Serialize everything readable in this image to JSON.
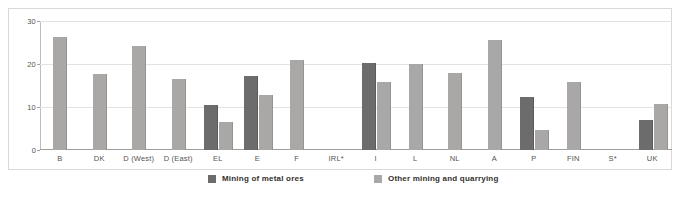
{
  "chart_data": {
    "type": "bar",
    "title": "",
    "subtitle": "",
    "xlabel": "",
    "ylabel": "",
    "ylim": [
      0,
      30
    ],
    "yticks": [
      0,
      10,
      20,
      30
    ],
    "ytick_labels": [
      "0",
      "10",
      "20",
      "30"
    ],
    "grid": true,
    "legend_position": "bottom",
    "categories": [
      "B",
      "DK",
      "D (West)",
      "D (East)",
      "EL",
      "E",
      "F",
      "IRL*",
      "I",
      "L",
      "NL",
      "A",
      "P",
      "FIN",
      "S*",
      "UK"
    ],
    "series": [
      {
        "name": "Mining of metal ores",
        "color": "#6d6c6c",
        "values": [
          null,
          null,
          null,
          null,
          10.5,
          17.3,
          null,
          null,
          20.3,
          null,
          null,
          null,
          12.4,
          null,
          null,
          7.0
        ]
      },
      {
        "name": "Other mining and quarrying",
        "color": "#a9a8a6",
        "values": [
          26.2,
          17.7,
          24.3,
          16.4,
          6.5,
          12.8,
          20.9,
          null,
          15.8,
          20.0,
          18.0,
          25.7,
          4.7,
          15.9,
          null,
          10.7
        ]
      }
    ]
  },
  "legend": {
    "items": [
      {
        "label": "Mining of metal ores",
        "swatch": "dark"
      },
      {
        "label": "Other mining and quarrying",
        "swatch": "light"
      }
    ]
  },
  "colors": {
    "series_dark": "#6d6c6c",
    "series_light": "#a9a8a6",
    "gridline": "#e2e2e2",
    "axis": "#9e9e9e",
    "frame": "#d9d9d9",
    "text": "#55534f"
  }
}
